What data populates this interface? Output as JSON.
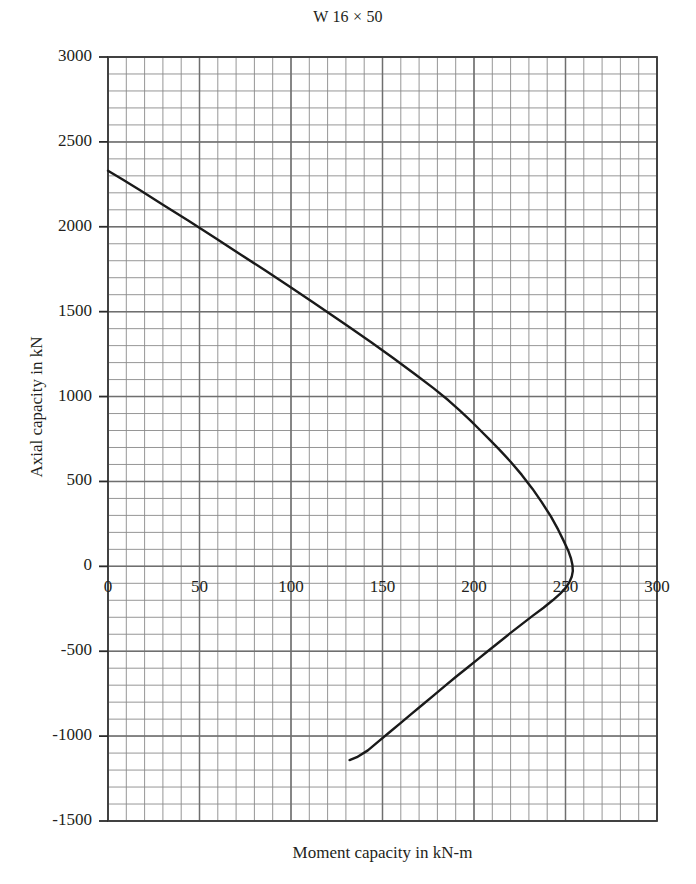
{
  "chart_data": {
    "type": "line",
    "title": "W 16 × 50",
    "xlabel": "Moment capacity in kN-m",
    "ylabel": "Axial capacity in kN",
    "xlim": [
      0,
      300
    ],
    "ylim": [
      -1500,
      3000
    ],
    "xticks": [
      0,
      50,
      100,
      150,
      200,
      250,
      300
    ],
    "yticks": [
      -1500,
      -1000,
      -500,
      0,
      500,
      1000,
      1500,
      2000,
      2500,
      3000
    ],
    "xtick_labels": [
      "0",
      "50",
      "100",
      "150",
      "200",
      "250",
      "300"
    ],
    "ytick_labels": [
      "-1500",
      "-1000",
      "-500",
      "0",
      "500",
      "1000",
      "1500",
      "2000",
      "2500",
      "3000"
    ],
    "x_minor_step": 10,
    "y_minor_step": 100,
    "grid": true,
    "grid_color": "#6f6f6f",
    "minor_grid_color": "#8a8a8a",
    "legend": null,
    "line_color": "#1a1a1a",
    "line_width": 2.4,
    "series": [
      {
        "name": "P-M interaction capacity curve",
        "points": [
          [
            0,
            2330
          ],
          [
            8,
            2278
          ],
          [
            18,
            2212
          ],
          [
            30,
            2130
          ],
          [
            44,
            2035
          ],
          [
            58,
            1938
          ],
          [
            72,
            1840
          ],
          [
            86,
            1742
          ],
          [
            100,
            1642
          ],
          [
            112,
            1556
          ],
          [
            122,
            1482
          ],
          [
            132,
            1408
          ],
          [
            144,
            1318
          ],
          [
            156,
            1226
          ],
          [
            168,
            1130
          ],
          [
            178,
            1048
          ],
          [
            186,
            978
          ],
          [
            192,
            920
          ],
          [
            198,
            860
          ],
          [
            203,
            806
          ],
          [
            208,
            752
          ],
          [
            214,
            686
          ],
          [
            220,
            616
          ],
          [
            226,
            540
          ],
          [
            232,
            456
          ],
          [
            237,
            378
          ],
          [
            242,
            294
          ],
          [
            246,
            216
          ],
          [
            249,
            150
          ],
          [
            251.5,
            92
          ],
          [
            253,
            46
          ],
          [
            253.8,
            8
          ],
          [
            254,
            -28
          ],
          [
            253.4,
            -62
          ],
          [
            252,
            -96
          ],
          [
            250,
            -128
          ],
          [
            247,
            -162
          ],
          [
            243,
            -200
          ],
          [
            238,
            -244
          ],
          [
            232,
            -292
          ],
          [
            226,
            -342
          ],
          [
            220,
            -392
          ],
          [
            214,
            -444
          ],
          [
            208,
            -496
          ],
          [
            202,
            -548
          ],
          [
            196,
            -600
          ],
          [
            190,
            -652
          ],
          [
            184,
            -706
          ],
          [
            178,
            -760
          ],
          [
            172,
            -814
          ],
          [
            166,
            -868
          ],
          [
            160,
            -922
          ],
          [
            154,
            -976
          ],
          [
            148,
            -1030
          ],
          [
            142,
            -1084
          ],
          [
            136,
            -1124
          ],
          [
            132,
            -1141
          ]
        ]
      }
    ]
  },
  "axes": {
    "title_text": "W 16 × 50",
    "x_title": "Moment capacity in kN-m",
    "y_title": "Axial capacity in kN"
  }
}
